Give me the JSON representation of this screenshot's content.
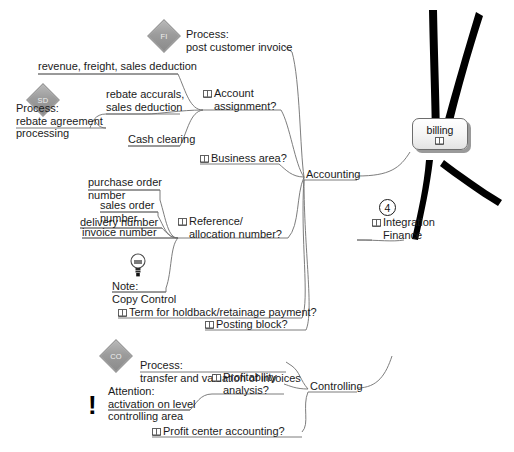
{
  "diagram": {
    "type": "mind-map",
    "title": "billing",
    "central": {
      "label": "billing",
      "icon": "book-icon"
    },
    "badges": [
      {
        "id": "fi",
        "label": "FI"
      },
      {
        "id": "sd",
        "label": "SD"
      },
      {
        "id": "co",
        "label": "CO"
      }
    ],
    "branches": [
      {
        "label": "Accounting",
        "children": [
          {
            "label": "Process:\npost customer invoice",
            "icon": null
          },
          {
            "label": "Account\nassignment?",
            "icon": "book-icon",
            "children": [
              {
                "label": "revenue, freight, sales deduction"
              },
              {
                "label": "rebate accurals,\nsales deduction"
              },
              {
                "label": "Cash clearing"
              },
              {
                "label": "Process:\nrebate agreement\nprocessing",
                "badge": "SD"
              }
            ]
          },
          {
            "label": "Business area?",
            "icon": "book-icon"
          },
          {
            "label": "Reference/\nallocation number?",
            "icon": "book-icon",
            "children": [
              {
                "label": "purchase order\nnumber"
              },
              {
                "label": "sales order\nnumber"
              },
              {
                "label": "delivery number"
              },
              {
                "label": "invoice number"
              },
              {
                "label": "Note:\nCopy Control",
                "icon": "lightbulb-icon"
              }
            ]
          },
          {
            "label": "Term for holdback/retainage payment?",
            "icon": "book-icon"
          },
          {
            "label": "Posting block?",
            "icon": "book-icon"
          }
        ]
      },
      {
        "label": "Controlling",
        "children": [
          {
            "label": "Process:\ntransfer and valuation of invoices",
            "badge": "CO"
          },
          {
            "label": "Profitability\nanalysis?",
            "icon": "book-icon",
            "children": [
              {
                "label": "Attention:\nactivation on level\ncontrolling area",
                "icon": "exclamation-icon"
              }
            ]
          },
          {
            "label": "Profit center accounting?",
            "icon": "book-icon"
          }
        ]
      },
      {
        "label": "Integration\nFinance",
        "icon": "book-icon",
        "marker": "4"
      }
    ]
  },
  "labels": {
    "process_post_customer_invoice_l1": "Process:",
    "process_post_customer_invoice_l2": "post customer invoice",
    "revenue_freight_sales_deduction": "revenue, freight, sales deduction",
    "rebate_accurals_l1": "rebate accurals,",
    "rebate_accurals_l2": "sales deduction",
    "cash_clearing": "Cash clearing",
    "process_rebate_l1": "Process:",
    "process_rebate_l2": "rebate agreement",
    "process_rebate_l3": "processing",
    "account_assignment_l1": "Account",
    "account_assignment_l2": "assignment?",
    "business_area": "Business area?",
    "purchase_order_l1": "purchase order",
    "purchase_order_l2": "number",
    "sales_order_l1": "sales order",
    "sales_order_l2": "number",
    "delivery_number": "delivery number",
    "invoice_number": "invoice number",
    "note_l1": "Note:",
    "note_l2": "Copy Control",
    "reference_allocation_l1": "Reference/",
    "reference_allocation_l2": "allocation number?",
    "term_holdback": "Term for holdback/retainage payment?",
    "posting_block": "Posting block?",
    "accounting": "Accounting",
    "process_transfer_l1": "Process:",
    "process_transfer_l2": "transfer and valuation of invoices",
    "attention_l1": "Attention:",
    "attention_l2": "activation on level",
    "attention_l3": "controlling area",
    "profitability_l1": "Profitability",
    "profitability_l2": "analysis?",
    "profit_center": "Profit center accounting?",
    "controlling": "Controlling",
    "integration_l1": "Integration",
    "integration_l2": "Finance",
    "integration_marker": "4",
    "central_label": "billing",
    "badge_fi": "FI",
    "badge_sd": "SD",
    "badge_co": "CO",
    "exclamation": "!"
  },
  "colors": {
    "background": "#ffffff",
    "text": "#1b1b1b",
    "thin_branch": "#6e6e6e",
    "thick_branch": "#000000",
    "badge_fill": "#9c9c9c",
    "central_border": "#6d6d6d",
    "central_shadow": "#9a9a9a"
  }
}
